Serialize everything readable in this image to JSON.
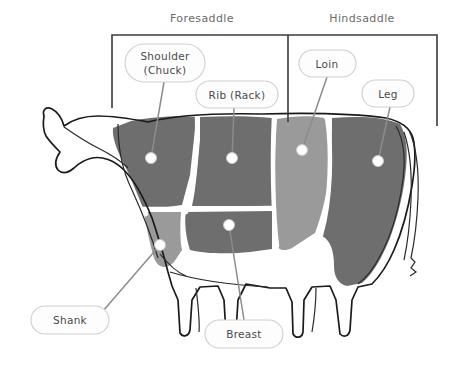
{
  "saddles": [
    {
      "id": "foresaddle",
      "label": "Foresaddle",
      "text_x": 202,
      "text_y": 18,
      "bracket_x1": 112,
      "bracket_x2": 288,
      "bracket_top": 35,
      "bracket_bottom": 108
    },
    {
      "id": "hindsaddle",
      "label": "Hindsaddle",
      "text_x": 362,
      "text_y": 18,
      "bracket_x1": 288,
      "bracket_x2": 437,
      "bracket_top": 35,
      "bracket_bottom": 126
    }
  ],
  "callouts": [
    {
      "id": "shoulder",
      "lines": [
        "Shoulder",
        "(Chuck)"
      ],
      "line1": "Shoulder",
      "line2": "(Chuck)",
      "pill": {
        "x": 125,
        "y": 44,
        "w": 80,
        "h": 38,
        "r": 19
      },
      "anchor": {
        "x": 164,
        "y": 82
      },
      "dot": {
        "x": 151,
        "y": 158,
        "r": 5.5
      },
      "color": "#6e6e6e"
    },
    {
      "id": "rib",
      "lines": [
        "Rib (Rack)"
      ],
      "line1": "Rib (Rack)",
      "pill": {
        "x": 196,
        "y": 81,
        "w": 82,
        "h": 27,
        "r": 13.5
      },
      "anchor": {
        "x": 234,
        "y": 108
      },
      "dot": {
        "x": 232,
        "y": 158,
        "r": 5.5
      },
      "color": "#6e6e6e"
    },
    {
      "id": "loin",
      "lines": [
        "Loin"
      ],
      "line1": "Loin",
      "pill": {
        "x": 299,
        "y": 50,
        "w": 57,
        "h": 27,
        "r": 13.5
      },
      "anchor": {
        "x": 327,
        "y": 77
      },
      "dot": {
        "x": 302,
        "y": 150,
        "r": 5.5
      },
      "color": "#9a9a9a"
    },
    {
      "id": "leg",
      "lines": [
        "Leg"
      ],
      "line1": "Leg",
      "pill": {
        "x": 362,
        "y": 80,
        "w": 52,
        "h": 27,
        "r": 13.5
      },
      "anchor": {
        "x": 390,
        "y": 107
      },
      "dot": {
        "x": 378,
        "y": 161,
        "r": 5.5
      },
      "color": "#6e6e6e"
    },
    {
      "id": "shank",
      "lines": [
        "Shank"
      ],
      "line1": "Shank",
      "pill": {
        "x": 31,
        "y": 306,
        "w": 78,
        "h": 28,
        "r": 14
      },
      "anchor": {
        "x": 103,
        "y": 311
      },
      "dot": {
        "x": 160,
        "y": 245,
        "r": 5.5
      },
      "color": "#9a9a9a"
    },
    {
      "id": "breast",
      "lines": [
        "Breast"
      ],
      "line1": "Breast",
      "pill": {
        "x": 205,
        "y": 320,
        "w": 78,
        "h": 28,
        "r": 14
      },
      "anchor": {
        "x": 244,
        "y": 320
      },
      "dot": {
        "x": 229,
        "y": 225,
        "r": 5.5
      },
      "color": "#6e6e6e"
    }
  ],
  "palette": {
    "dark_cut": "#6e6e6e",
    "light_cut": "#9a9a9a",
    "separator": "#ffffff",
    "outline": "#1a1a1a",
    "leader": "#8c8c8c",
    "pill_fill": "#fdfdfd",
    "pill_stroke": "#d0d0d0",
    "saddle_text": "#6b6b6b",
    "callout_text": "#4a4a4a",
    "background": "#ffffff"
  },
  "regions": [
    {
      "id": "shoulder-region",
      "name": "Shoulder (Chuck)",
      "shade": "dark"
    },
    {
      "id": "rib-region",
      "name": "Rib (Rack)",
      "shade": "dark"
    },
    {
      "id": "breast-region",
      "name": "Breast",
      "shade": "dark"
    },
    {
      "id": "shank-region",
      "name": "Shank",
      "shade": "light"
    },
    {
      "id": "loin-region",
      "name": "Loin",
      "shade": "light"
    },
    {
      "id": "leg-region",
      "name": "Leg",
      "shade": "dark"
    }
  ]
}
